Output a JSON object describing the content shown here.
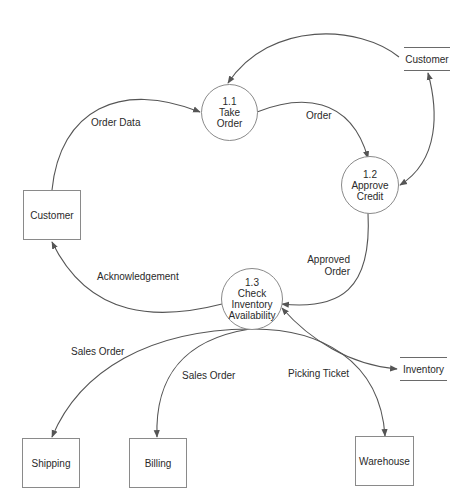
{
  "diagram": {
    "type": "data-flow-diagram",
    "processes": [
      {
        "id": "1.1",
        "number": "1.1",
        "lines": [
          "Take",
          "Order"
        ]
      },
      {
        "id": "1.2",
        "number": "1.2",
        "lines": [
          "Approve",
          "Credit"
        ]
      },
      {
        "id": "1.3",
        "number": "1.3",
        "lines": [
          "Check",
          "Inventory",
          "Availability"
        ]
      }
    ],
    "entities": {
      "customer": "Customer",
      "shipping": "Shipping",
      "billing": "Billing",
      "warehouse": "Warehouse"
    },
    "stores": {
      "customer": "Customer",
      "inventory": "Inventory"
    },
    "flows": {
      "order_data": "Order Data",
      "order": "Order",
      "approved_order_1": "Approved",
      "approved_order_2": "Order",
      "acknowledgement": "Acknowledgement",
      "sales_order_shipping": "Sales Order",
      "sales_order_billing": "Sales Order",
      "picking_ticket": "Picking Ticket"
    },
    "edges": [
      {
        "from": "Customer (entity)",
        "to": "1.1",
        "label": "Order Data"
      },
      {
        "from": "Customer (store)",
        "to": "1.1",
        "label": ""
      },
      {
        "from": "1.1",
        "to": "1.2",
        "label": "Order"
      },
      {
        "from": "1.2",
        "to": "Customer (store)",
        "label": "",
        "bidirectional": true
      },
      {
        "from": "1.2",
        "to": "1.3",
        "label": "Approved Order"
      },
      {
        "from": "1.3",
        "to": "Customer (entity)",
        "label": "Acknowledgement"
      },
      {
        "from": "1.3",
        "to": "Inventory (store)",
        "label": "",
        "bidirectional": true
      },
      {
        "from": "1.3",
        "to": "Shipping",
        "label": "Sales Order"
      },
      {
        "from": "1.3",
        "to": "Billing",
        "label": "Sales Order"
      },
      {
        "from": "1.3",
        "to": "Warehouse",
        "label": "Picking Ticket"
      }
    ],
    "colors": {
      "line": "#555555",
      "border": "#8a8a8a",
      "text": "#2a2a2a"
    }
  }
}
